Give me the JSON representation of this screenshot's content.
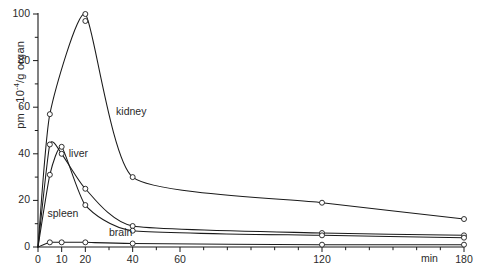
{
  "chart_data": {
    "type": "line",
    "title": "",
    "subtitle": "",
    "xlabel": "min",
    "ylabel": "pm · 10-4/g organ",
    "ylabel_base": "pm · 10",
    "ylabel_exp": "-4",
    "ylabel_tail": "/g organ",
    "xlim": [
      0,
      180
    ],
    "ylim": [
      0,
      100
    ],
    "grid": false,
    "legend_position": "inline-annotations",
    "xticks": [
      0,
      10,
      20,
      30,
      40,
      50,
      60,
      70,
      80,
      90,
      100,
      110,
      120,
      130,
      140,
      150,
      160,
      170,
      180
    ],
    "xtick_labels": [
      {
        "value": 0,
        "label": "0"
      },
      {
        "value": 10,
        "label": "10"
      },
      {
        "value": 20,
        "label": "20"
      },
      {
        "value": 40,
        "label": "40"
      },
      {
        "value": 60,
        "label": "60"
      },
      {
        "value": 120,
        "label": "120"
      },
      {
        "value": 180,
        "label": "180"
      }
    ],
    "yticks": [
      0,
      10,
      20,
      30,
      40,
      50,
      60,
      70,
      80,
      90,
      100
    ],
    "ytick_labels": [
      {
        "value": 0,
        "label": "0"
      },
      {
        "value": 20,
        "label": "20"
      },
      {
        "value": 40,
        "label": "40"
      },
      {
        "value": 60,
        "label": "60"
      },
      {
        "value": 80,
        "label": "80"
      },
      {
        "value": 100,
        "label": "100"
      }
    ],
    "marker": "open-circle",
    "series": [
      {
        "name": "kidney",
        "label": "kidney",
        "color": "#1a1a1a",
        "annotation": {
          "x": 33,
          "y": 58
        },
        "points": [
          {
            "x": 0,
            "y": 0
          },
          {
            "x": 5,
            "y": 57
          },
          {
            "x": 20,
            "y": 100
          },
          {
            "x": 20,
            "y": 97
          },
          {
            "x": 40,
            "y": 30
          },
          {
            "x": 120,
            "y": 19
          },
          {
            "x": 180,
            "y": 12
          }
        ]
      },
      {
        "name": "liver",
        "label": "liver",
        "color": "#1a1a1a",
        "annotation": {
          "x": 13,
          "y": 40
        },
        "points": [
          {
            "x": 0,
            "y": 0
          },
          {
            "x": 5,
            "y": 44
          },
          {
            "x": 10,
            "y": 40
          },
          {
            "x": 20,
            "y": 25
          },
          {
            "x": 40,
            "y": 9
          },
          {
            "x": 120,
            "y": 6
          },
          {
            "x": 180,
            "y": 5
          }
        ]
      },
      {
        "name": "spleen",
        "label": "spleen",
        "color": "#1a1a1a",
        "annotation": {
          "x": 4,
          "y": 14
        },
        "points": [
          {
            "x": 0,
            "y": 0
          },
          {
            "x": 5,
            "y": 31
          },
          {
            "x": 10,
            "y": 43
          },
          {
            "x": 20,
            "y": 18
          },
          {
            "x": 40,
            "y": 7
          },
          {
            "x": 120,
            "y": 5
          },
          {
            "x": 180,
            "y": 4
          }
        ]
      },
      {
        "name": "brain",
        "label": "brain",
        "color": "#1a1a1a",
        "annotation": {
          "x": 30,
          "y": 6
        },
        "points": [
          {
            "x": 0,
            "y": 0
          },
          {
            "x": 5,
            "y": 2
          },
          {
            "x": 10,
            "y": 2
          },
          {
            "x": 20,
            "y": 2
          },
          {
            "x": 40,
            "y": 1.5
          },
          {
            "x": 120,
            "y": 1
          },
          {
            "x": 180,
            "y": 1
          }
        ]
      }
    ]
  }
}
